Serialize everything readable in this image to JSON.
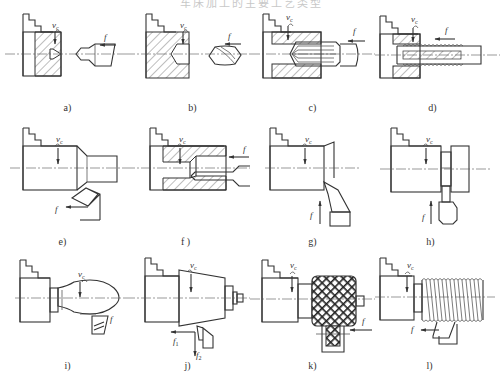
{
  "figure": {
    "title": "车床加工的主要工艺类型",
    "panels": [
      {
        "id": "a",
        "caption": "a)",
        "operation": "center-drilling",
        "labels": {
          "cutting_speed": "v",
          "cutting_speed_sub": "c",
          "feed": "f"
        }
      },
      {
        "id": "b",
        "caption": "b)",
        "operation": "drilling",
        "labels": {
          "cutting_speed": "v",
          "cutting_speed_sub": "c",
          "feed": "f"
        }
      },
      {
        "id": "c",
        "caption": "c)",
        "operation": "reaming",
        "labels": {
          "cutting_speed": "v",
          "cutting_speed_sub": "c",
          "feed": "f"
        }
      },
      {
        "id": "d",
        "caption": "d)",
        "operation": "tapping",
        "labels": {
          "cutting_speed": "v",
          "cutting_speed_sub": "c",
          "feed": "f"
        }
      },
      {
        "id": "e",
        "caption": "e)",
        "operation": "external-turning",
        "labels": {
          "cutting_speed": "v",
          "cutting_speed_sub": "c",
          "feed": "f"
        }
      },
      {
        "id": "f",
        "caption": "f )",
        "operation": "boring",
        "labels": {
          "cutting_speed": "v",
          "cutting_speed_sub": "c",
          "feed": "f"
        }
      },
      {
        "id": "g",
        "caption": "g)",
        "operation": "facing",
        "labels": {
          "cutting_speed": "v",
          "cutting_speed_sub": "c",
          "feed": "f"
        }
      },
      {
        "id": "h",
        "caption": "h)",
        "operation": "parting-off",
        "labels": {
          "cutting_speed": "v",
          "cutting_speed_sub": "c",
          "feed": "f"
        }
      },
      {
        "id": "i",
        "caption": "i)",
        "operation": "form-turning",
        "labels": {
          "cutting_speed": "v",
          "cutting_speed_sub": "c",
          "feed": "f"
        }
      },
      {
        "id": "j",
        "caption": "j)",
        "operation": "taper-turning",
        "labels": {
          "cutting_speed": "v",
          "cutting_speed_sub": "c",
          "feed1": "f",
          "feed1_sub": "1",
          "feed2": "f",
          "feed2_sub": "2"
        }
      },
      {
        "id": "k",
        "caption": "k)",
        "operation": "knurling",
        "labels": {
          "cutting_speed": "v",
          "cutting_speed_sub": "c",
          "feed": "f"
        }
      },
      {
        "id": "l",
        "caption": "l)",
        "operation": "thread-cutting",
        "labels": {
          "cutting_speed": "v",
          "cutting_speed_sub": "c",
          "feed": "f"
        }
      }
    ]
  }
}
